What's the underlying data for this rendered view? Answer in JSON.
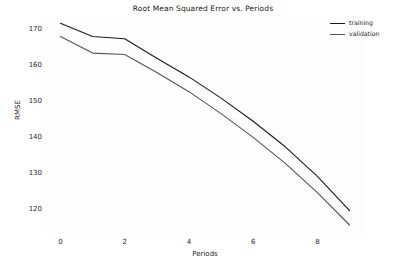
{
  "chart_data": {
    "type": "line",
    "title": "Root Mean Squared Error vs. Periods",
    "xlabel": "Periods",
    "ylabel": "RMSE",
    "x": [
      0,
      1,
      2,
      3,
      4,
      5,
      6,
      7,
      8,
      9
    ],
    "series": [
      {
        "name": "training",
        "color": "#1a1a1a",
        "values": [
          171.5,
          167.8,
          167.2,
          161.8,
          156.6,
          150.7,
          144.3,
          137.2,
          129.0,
          119.5
        ]
      },
      {
        "name": "validation",
        "color": "#555555",
        "values": [
          167.8,
          163.2,
          162.8,
          157.8,
          152.5,
          146.4,
          139.8,
          132.6,
          124.5,
          115.5
        ]
      }
    ],
    "xlim": [
      -0.45,
      9.45
    ],
    "ylim": [
      113.0,
      173.5
    ],
    "xticks": [
      0,
      2,
      4,
      6,
      8
    ],
    "xtick_labels": [
      "0",
      "2",
      "4",
      "6",
      "8"
    ],
    "yticks": [
      120,
      130,
      140,
      150,
      160,
      170
    ],
    "ytick_labels": [
      "120",
      "130",
      "140",
      "150",
      "160",
      "170"
    ],
    "grid": false,
    "legend_position": "upper right",
    "background_color": "#fdfdfd",
    "figure_color": "#ffffff"
  }
}
